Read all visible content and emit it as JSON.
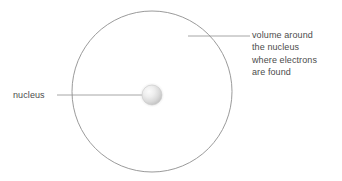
{
  "diagram": {
    "background_color": "#ffffff",
    "stroke_color": "#8f8f8f",
    "text_color": "#4c4c4c",
    "electron_shell": {
      "name": "electron-shell-circle",
      "center_x": 152,
      "center_y": 91.5,
      "radius_x": 80,
      "radius_y": 80.5
    },
    "nucleus": {
      "name": "nucleus-sphere",
      "center_x": 152,
      "center_y": 95,
      "radius": 10,
      "fill_light": "#f2f2f2",
      "fill_dark": "#bdbdbd"
    },
    "labels": {
      "nucleus": {
        "text": "nucleus",
        "leader_x1": 57,
        "leader_x2": 150,
        "leader_y": 95
      },
      "electron_volume": {
        "lines": [
          "volume around",
          "the nucleus",
          "where electrons",
          "are found"
        ],
        "leader_x1": 188,
        "leader_x2": 250,
        "leader_y": 36
      }
    }
  }
}
